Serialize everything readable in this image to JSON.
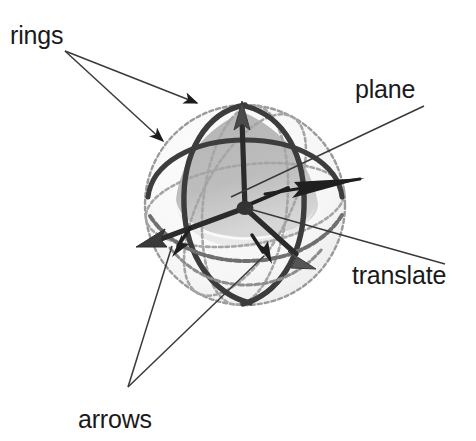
{
  "figure": {
    "background_color": "#ffffff",
    "width": 476,
    "height": 441
  },
  "annotations": {
    "rings": {
      "label": "rings",
      "x": 10,
      "y": 44,
      "leader_origin": [
        65,
        51
      ],
      "leader_targets": [
        [
          201,
          104
        ],
        [
          166,
          143
        ]
      ]
    },
    "plane": {
      "label": "plane",
      "x": 355,
      "y": 98,
      "leader_origin": [
        424,
        106
      ],
      "leader_targets": [
        [
          229,
          196
        ]
      ]
    },
    "translate": {
      "label": "translate",
      "x": 352,
      "y": 284,
      "leader_origin": [
        445,
        264
      ],
      "leader_targets": [
        [
          244,
          207
        ]
      ]
    },
    "arrows": {
      "label": "arrows",
      "x": 78,
      "y": 428,
      "leader_origin": [
        128,
        387
      ],
      "leader_targets": [
        [
          173,
          243
        ],
        [
          266,
          255
        ]
      ]
    }
  },
  "gizmo": {
    "center": [
      245,
      208
    ],
    "sphere_radius": 100,
    "colors": {
      "sphere_outline": "#8f8f8f",
      "ring_dark": "#3a3a3a",
      "ring_mid": "#6e6e6e",
      "plane_fill": "#b9b9b9",
      "plane_fill_light": "#d2d2d2",
      "arrow": "#2b2b2b",
      "leader_line": "#3a3a3a",
      "text": "#1a1a1a"
    },
    "parts": [
      {
        "name": "rotation-ring-vertical",
        "description": "dark great-circle ring in the vertical plane"
      },
      {
        "name": "rotation-ring-horizontal",
        "description": "dark great-circle ring in the horizontal plane"
      },
      {
        "name": "rotation-ring-oblique",
        "description": "dark great-circle ring tilted obliquely"
      },
      {
        "name": "sphere-outline",
        "description": "light dotted bounding sphere silhouette"
      },
      {
        "name": "axis-arrow-up",
        "tip": [
          242,
          104
        ]
      },
      {
        "name": "axis-arrow-lower-left",
        "tip": [
          142,
          243
        ]
      },
      {
        "name": "axis-arrow-lower-right",
        "tip": [
          310,
          262
        ]
      },
      {
        "name": "plane-arrow-upper",
        "tip": [
          352,
          268
        ]
      },
      {
        "name": "plane-arrow-lower-left",
        "tip": [
          175,
          253
        ]
      },
      {
        "name": "plane-arrow-lower-right",
        "tip": [
          268,
          262
        ]
      },
      {
        "name": "plane-triangle",
        "description": "gray spherical-triangle plane patch inside the sphere"
      },
      {
        "name": "center-hub",
        "description": "dark pivot node at the gizmo origin"
      }
    ]
  }
}
